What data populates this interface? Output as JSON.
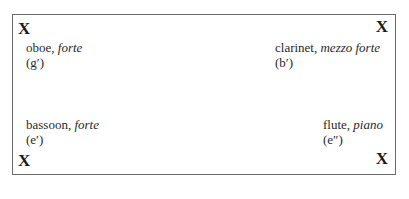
{
  "diagram": {
    "marks": [
      {
        "id": "top-left",
        "symbol": "X"
      },
      {
        "id": "top-right",
        "symbol": "X"
      },
      {
        "id": "bottom-left",
        "symbol": "X"
      },
      {
        "id": "bottom-right",
        "symbol": "X"
      }
    ],
    "instruments": [
      {
        "name": "oboe,",
        "dynamic": "forte",
        "pitch": "(g′)"
      },
      {
        "name": "clarinet,",
        "dynamic": "mezzo forte",
        "pitch": "(b′)"
      },
      {
        "name": "bassoon,",
        "dynamic": "forte",
        "pitch": "(e′)"
      },
      {
        "name": "flute,",
        "dynamic": "piano",
        "pitch": "(e″)"
      }
    ]
  }
}
